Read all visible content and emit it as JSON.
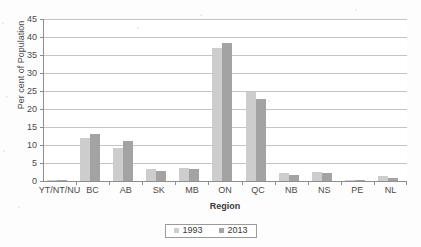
{
  "chart_data": {
    "type": "bar",
    "title": "",
    "xlabel": "Region",
    "ylabel": "Per cent of  Population",
    "categories": [
      "YT/NT/NU",
      "BC",
      "AB",
      "SK",
      "MB",
      "ON",
      "QC",
      "NB",
      "NS",
      "PE",
      "NL"
    ],
    "series": [
      {
        "name": "1993",
        "color": "#cdcdcd",
        "values": [
          0.1,
          12.0,
          9.2,
          3.2,
          3.6,
          36.9,
          24.6,
          2.1,
          2.5,
          0.4,
          1.3
        ]
      },
      {
        "name": "2013",
        "color": "#a3a3a3",
        "values": [
          0.1,
          13.0,
          11.0,
          2.9,
          3.4,
          38.3,
          22.7,
          1.8,
          2.2,
          0.4,
          0.8
        ]
      }
    ],
    "ylim": [
      0,
      45
    ],
    "yticks": [
      0,
      5,
      10,
      15,
      20,
      25,
      30,
      35,
      40,
      45
    ],
    "ytick_labels": [
      "0",
      "5",
      "10",
      "15",
      "20",
      "25",
      "30",
      "35",
      "40",
      "45"
    ],
    "grid": true,
    "legend_position": "bottom"
  },
  "axes": {
    "y_title": "Per cent of  Population",
    "x_title": "Region"
  },
  "legend": {
    "items": [
      {
        "label": "1993",
        "color": "#cdcdcd"
      },
      {
        "label": "2013",
        "color": "#a3a3a3"
      }
    ]
  },
  "colors": {
    "series_1993": "#cdcdcd",
    "series_2013": "#a3a3a3",
    "gridline": "#c4c4c4",
    "axis": "#8e8e8e",
    "text": "#4a4a4a",
    "background": "#fdfdfd"
  }
}
